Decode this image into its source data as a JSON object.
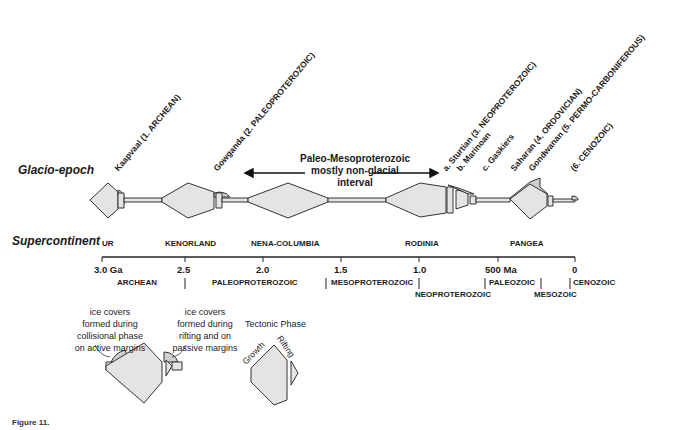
{
  "rows": {
    "glacio_epoch_label": "Glacio-epoch",
    "supercontinent_label": "Supercontinent"
  },
  "glacio_epochs": [
    {
      "label": "Kaapvaal (1. ARCHEAN)"
    },
    {
      "label": "Gowganda (2. PALEOPROTEROZOIC)"
    },
    {
      "label": "a. Sturtian (3. NEOPROTEROZOIC)"
    },
    {
      "label": "b. Marinoan"
    },
    {
      "label": "c. Gaskiers"
    },
    {
      "label": "Saharan (4. ORDOVICIAN)"
    },
    {
      "label": "Gondwanan (5. PERMO-CARBONIFEROUS)"
    },
    {
      "label": "(6. CENOZOIC)"
    }
  ],
  "interval_note": {
    "line1": "Paleo-Mesoproterozoic",
    "line2": "mostly non-glacial",
    "line3": "interval"
  },
  "supercontinents": [
    {
      "label": "UR"
    },
    {
      "label": "KENORLAND"
    },
    {
      "label": "NENA-COLUMBIA"
    },
    {
      "label": "RODINIA"
    },
    {
      "label": "PANGEA"
    }
  ],
  "axis": {
    "ticks": [
      "3.0 Ga",
      "2.5",
      "2.0",
      "1.5",
      "1.0",
      "500 Ma",
      "0"
    ]
  },
  "eras": [
    {
      "label": "ARCHEAN"
    },
    {
      "label": "PALEOPROTEROZOIC"
    },
    {
      "label": "MESOPROTEROZOIC"
    },
    {
      "label": "NEOPROTEROZOIC"
    },
    {
      "label": "PALEOZOIC"
    },
    {
      "label": "MESOZOIC"
    },
    {
      "label": "CENOZOIC"
    }
  ],
  "legend": {
    "collisional_line1": "ice covers",
    "collisional_line2": "formed during",
    "collisional_line3": "collisional phase",
    "collisional_line4": "on active margins",
    "rifting_line1": "ice covers",
    "rifting_line2": "formed during",
    "rifting_line3": "rifting and on",
    "rifting_line4": "passive margins",
    "tectonic_title": "Tectonic Phase",
    "growth": "Growth",
    "rifting": "Rifting"
  },
  "caption": "Figure 11."
}
